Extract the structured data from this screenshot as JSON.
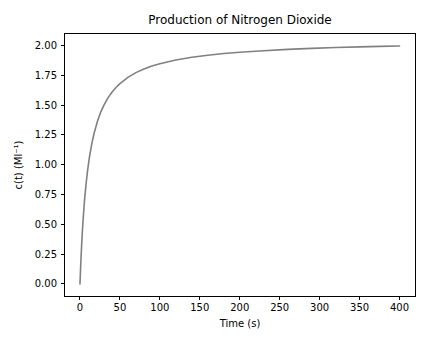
{
  "figure": {
    "title": "Production of Nitrogen Dioxide",
    "xlabel": "Time (s)",
    "ylabel": "c(t) (Ml⁻¹)"
  },
  "colors": {
    "background": "#ffffff",
    "axes": "#000000",
    "line": "#808080"
  },
  "chart_data": {
    "type": "line",
    "title": "Production of Nitrogen Dioxide",
    "xlabel": "Time (s)",
    "ylabel": "c(t) (Ml⁻¹)",
    "xlim": [
      -20,
      420
    ],
    "ylim": [
      -0.105,
      2.1
    ],
    "grid": false,
    "x_ticks": {
      "values": [
        0,
        50,
        100,
        150,
        200,
        250,
        300,
        350,
        400
      ],
      "labels": [
        "0",
        "50",
        "100",
        "150",
        "200",
        "250",
        "300",
        "350",
        "400"
      ]
    },
    "y_ticks": {
      "values": [
        0.0,
        0.25,
        0.5,
        0.75,
        1.0,
        1.25,
        1.5,
        1.75,
        2.0
      ],
      "labels": [
        "0.00",
        "0.25",
        "0.50",
        "0.75",
        "1.00",
        "1.25",
        "1.50",
        "1.75",
        "2.00"
      ]
    },
    "series": [
      {
        "name": "c(t)",
        "color": "#808080",
        "line_width": 1.6,
        "x": [
          0,
          0.5,
          1,
          2,
          3,
          4,
          5,
          6,
          8,
          10,
          12,
          15,
          18,
          22,
          26,
          30,
          35,
          40,
          45,
          50,
          60,
          70,
          80,
          90,
          100,
          120,
          140,
          160,
          180,
          200,
          230,
          260,
          290,
          320,
          350,
          375,
          400
        ],
        "y": [
          0.0,
          0.089,
          0.171,
          0.315,
          0.439,
          0.547,
          0.641,
          0.724,
          0.863,
          0.976,
          1.07,
          1.183,
          1.272,
          1.367,
          1.441,
          1.5,
          1.56,
          1.608,
          1.647,
          1.68,
          1.732,
          1.772,
          1.802,
          1.827,
          1.847,
          1.878,
          1.901,
          1.918,
          1.932,
          1.943,
          1.956,
          1.967,
          1.975,
          1.982,
          1.988,
          1.992,
          1.995
        ]
      }
    ]
  }
}
